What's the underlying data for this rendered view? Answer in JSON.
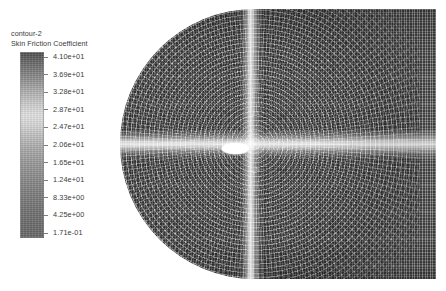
{
  "legend": {
    "title": "contour-2",
    "subtitle": "Skin Friction Coefficient",
    "colormap": "grayscale",
    "colorbar_top_color": "#4e4e4e",
    "colorbar_mid_color": "#e2e2e2",
    "colorbar_bottom_color": "#676767",
    "ticks": [
      {
        "value": "4.10e+01"
      },
      {
        "value": "3.69e+01"
      },
      {
        "value": "3.28e+01"
      },
      {
        "value": "2.87e+01"
      },
      {
        "value": "2.47e+01"
      },
      {
        "value": "2.06e+01"
      },
      {
        "value": "1.65e+01"
      },
      {
        "value": "1.24e+01"
      },
      {
        "value": "8.33e+00"
      },
      {
        "value": "4.25e+00"
      },
      {
        "value": "1.71e-01"
      }
    ]
  },
  "plot": {
    "name": "skin-friction-contour-mesh",
    "description": "Structured CFD mesh contour of skin friction coefficient",
    "body_color": "#ffffff",
    "mesh_color": "#6e6e6e"
  },
  "chart_data": {
    "type": "heatmap",
    "title": "contour-2",
    "subtitle": "Skin Friction Coefficient",
    "xlabel": "",
    "ylabel": "",
    "colormap": "grayscale",
    "legend_position": "left",
    "grid": true,
    "colorbar": {
      "min": 0.171,
      "max": 41.0,
      "tick_values": [
        41.0,
        36.9,
        32.8,
        28.7,
        24.7,
        20.6,
        16.5,
        12.4,
        8.33,
        4.25,
        0.171
      ],
      "tick_labels": [
        "4.10e+01",
        "3.69e+01",
        "3.28e+01",
        "2.87e+01",
        "2.47e+01",
        "2.06e+01",
        "1.65e+01",
        "1.24e+01",
        "8.33e+00",
        "4.25e+00",
        "1.71e-01"
      ],
      "units": ""
    },
    "features": [
      {
        "name": "rounded-leading-edge",
        "shape": "semicircular-o-grid",
        "side": "left"
      },
      {
        "name": "rectilinear-far-field",
        "shape": "rectangular-grid",
        "side": "right"
      },
      {
        "name": "horizontal-centerline-band",
        "orientation": "horizontal",
        "relative_value": "high"
      },
      {
        "name": "vertical-station-band",
        "orientation": "vertical",
        "relative_value": "high"
      },
      {
        "name": "elliptical-body",
        "shape": "ellipse",
        "fill": "#ffffff",
        "relative_value": "max"
      }
    ]
  }
}
